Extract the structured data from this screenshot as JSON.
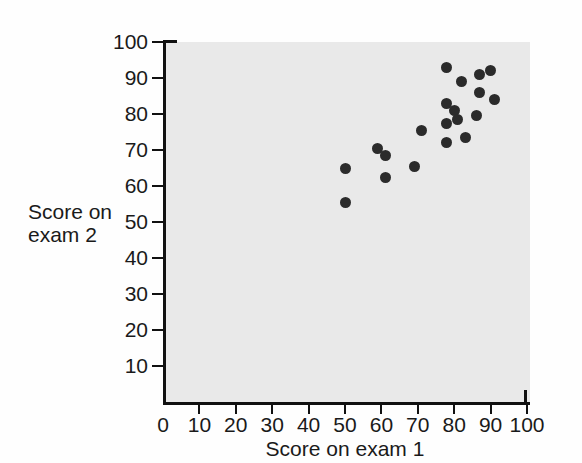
{
  "chart_data": {
    "type": "scatter",
    "title": "",
    "xlabel": "Score on exam 1",
    "ylabel": "Score on exam 2",
    "xlim": [
      0,
      100
    ],
    "ylim": [
      0,
      100
    ],
    "grid": false,
    "legend": null,
    "xticks": [
      "0",
      "10",
      "20",
      "30",
      "40",
      "50",
      "60",
      "70",
      "80",
      "90",
      "100"
    ],
    "yticks": [
      "10",
      "20",
      "30",
      "40",
      "50",
      "60",
      "70",
      "80",
      "90",
      "100"
    ],
    "xtick_values": [
      0,
      10,
      20,
      30,
      40,
      50,
      60,
      70,
      80,
      90,
      100
    ],
    "ytick_values": [
      10,
      20,
      30,
      40,
      50,
      60,
      70,
      80,
      90,
      100
    ],
    "marker": "filled-circle",
    "marker_color": "#2b2b2b",
    "plot_background": "#e9e9e9",
    "points": [
      {
        "x": 50,
        "y": 65
      },
      {
        "x": 50,
        "y": 55.5
      },
      {
        "x": 59,
        "y": 70.5
      },
      {
        "x": 61,
        "y": 68.5
      },
      {
        "x": 61,
        "y": 62.5
      },
      {
        "x": 69,
        "y": 65.5
      },
      {
        "x": 71,
        "y": 75.5
      },
      {
        "x": 78,
        "y": 93
      },
      {
        "x": 78,
        "y": 83
      },
      {
        "x": 78,
        "y": 77.5
      },
      {
        "x": 78,
        "y": 72
      },
      {
        "x": 80,
        "y": 81
      },
      {
        "x": 81,
        "y": 78.5
      },
      {
        "x": 82,
        "y": 89
      },
      {
        "x": 83,
        "y": 73.5
      },
      {
        "x": 86,
        "y": 79.5
      },
      {
        "x": 87,
        "y": 91
      },
      {
        "x": 87,
        "y": 86
      },
      {
        "x": 90,
        "y": 92
      },
      {
        "x": 91,
        "y": 84
      }
    ]
  },
  "axis": {
    "x_title": "Score on exam 1",
    "y_title_line1": "Score on",
    "y_title_line2": "exam 2"
  }
}
